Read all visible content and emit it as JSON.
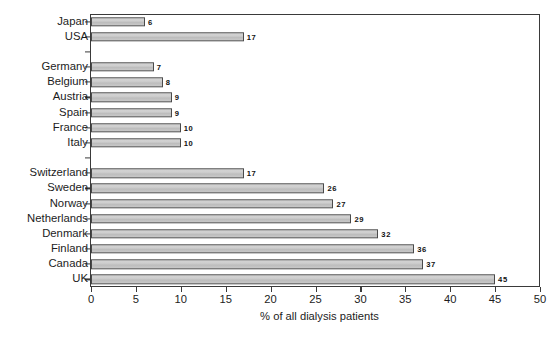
{
  "chart_data": {
    "type": "bar",
    "orientation": "horizontal",
    "title": "",
    "xlabel": "% of all dialysis patients",
    "ylabel": "",
    "xlim": [
      0,
      50
    ],
    "xticks": [
      0,
      5,
      10,
      15,
      20,
      25,
      30,
      35,
      40,
      45,
      50
    ],
    "grid": false,
    "legend": null,
    "categories": [
      "Japan",
      "USA",
      "",
      "Germany",
      "Belgium",
      "Austria",
      "Spain",
      "France",
      "Italy",
      "",
      "Switzerland",
      "Sweden",
      "Norway",
      "Netherlands",
      "Denmark",
      "Finland",
      "Canada",
      "UK"
    ],
    "values": [
      6,
      17,
      null,
      7,
      8,
      9,
      9,
      10,
      10,
      null,
      17,
      26,
      27,
      29,
      32,
      36,
      37,
      45
    ],
    "bars": [
      {
        "label": "Japan",
        "value": 6,
        "value_text": "6"
      },
      {
        "label": "USA",
        "value": 17,
        "value_text": "17"
      },
      {
        "label": "",
        "value": null,
        "value_text": ""
      },
      {
        "label": "Germany",
        "value": 7,
        "value_text": "7"
      },
      {
        "label": "Belgium",
        "value": 8,
        "value_text": "8"
      },
      {
        "label": "Austria",
        "value": 9,
        "value_text": "9"
      },
      {
        "label": "Spain",
        "value": 9,
        "value_text": "9"
      },
      {
        "label": "France",
        "value": 10,
        "value_text": "10"
      },
      {
        "label": "Italy",
        "value": 10,
        "value_text": "10"
      },
      {
        "label": "",
        "value": null,
        "value_text": ""
      },
      {
        "label": "Switzerland",
        "value": 17,
        "value_text": "17"
      },
      {
        "label": "Sweden",
        "value": 26,
        "value_text": "26"
      },
      {
        "label": "Norway",
        "value": 27,
        "value_text": "27"
      },
      {
        "label": "Netherlands",
        "value": 29,
        "value_text": "29"
      },
      {
        "label": "Denmark",
        "value": 32,
        "value_text": "32"
      },
      {
        "label": "Finland",
        "value": 36,
        "value_text": "36"
      },
      {
        "label": "Canada",
        "value": 37,
        "value_text": "37"
      },
      {
        "label": "UK",
        "value": 45,
        "value_text": "45"
      }
    ],
    "colors": {
      "bar_fill": "#cccccc",
      "bar_border": "#4a4a4a",
      "axis": "#3a3a3a",
      "text": "#1c1c1c",
      "background": "#ffffff"
    }
  }
}
